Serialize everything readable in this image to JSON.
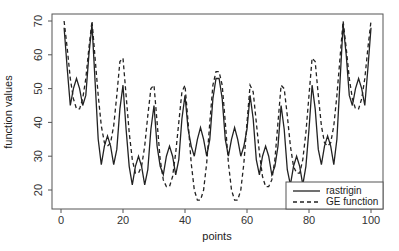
{
  "chart_data": {
    "type": "line",
    "title": "",
    "xlabel": "points",
    "ylabel": "function values",
    "xlim": [
      -2,
      103
    ],
    "ylim": [
      15,
      72
    ],
    "xticks": [
      0,
      20,
      40,
      60,
      80,
      100
    ],
    "yticks": [
      20,
      30,
      40,
      50,
      60,
      70
    ],
    "grid": false,
    "legend_position": "bottom-right",
    "x": [
      1,
      2,
      3,
      4,
      5,
      6,
      7,
      8,
      9,
      10,
      11,
      12,
      13,
      14,
      15,
      16,
      17,
      18,
      19,
      20,
      21,
      22,
      23,
      24,
      25,
      26,
      27,
      28,
      29,
      30,
      31,
      32,
      33,
      34,
      35,
      36,
      37,
      38,
      39,
      40,
      41,
      42,
      43,
      44,
      45,
      46,
      47,
      48,
      49,
      50,
      51,
      52,
      53,
      54,
      55,
      56,
      57,
      58,
      59,
      60,
      61,
      62,
      63,
      64,
      65,
      66,
      67,
      68,
      69,
      70,
      71,
      72,
      73,
      74,
      75,
      76,
      77,
      78,
      79,
      80,
      81,
      82,
      83,
      84,
      85,
      86,
      87,
      88,
      89,
      90,
      91,
      92,
      93,
      94,
      95,
      96,
      97,
      98,
      99,
      100
    ],
    "series": [
      {
        "name": "rastrigin",
        "style": "solid",
        "values": [
          68,
          56,
          45,
          50,
          53,
          50,
          45,
          48,
          60,
          69,
          52,
          35,
          27.5,
          33,
          36,
          33,
          27.5,
          32,
          44,
          51,
          38,
          27,
          21.5,
          27,
          30,
          27,
          21.5,
          26,
          38,
          45,
          33,
          27,
          24.5,
          30,
          33,
          30,
          24.5,
          29,
          41,
          48,
          38,
          33,
          30,
          35,
          38.5,
          35,
          30,
          35,
          47,
          53,
          53,
          47,
          35,
          30,
          35,
          38.5,
          35,
          30,
          33,
          38,
          48,
          41,
          29,
          24.5,
          30,
          33,
          30,
          24.5,
          27,
          33,
          45,
          38,
          26,
          21.5,
          27,
          30,
          27,
          21.5,
          27,
          38,
          51,
          44,
          32,
          27.5,
          33,
          36,
          33,
          27.5,
          35,
          52,
          69,
          60,
          48,
          45,
          50,
          53,
          50,
          45,
          56,
          68
        ]
      },
      {
        "name": "GE function",
        "style": "dashed",
        "values": [
          70,
          62,
          53,
          47,
          44,
          44,
          47,
          53,
          62,
          70,
          59,
          48,
          39,
          34,
          33,
          34,
          39,
          48,
          58,
          59,
          48,
          37,
          29,
          25,
          25,
          27,
          33,
          42,
          50,
          51,
          40,
          29,
          23,
          21,
          21,
          24,
          31,
          40,
          49,
          51,
          40,
          28,
          20,
          17,
          17,
          20,
          28,
          40,
          51,
          55,
          55,
          51,
          40,
          28,
          20,
          17,
          17,
          20,
          28,
          40,
          51,
          49,
          40,
          31,
          24,
          21,
          21,
          23,
          29,
          40,
          51,
          50,
          42,
          33,
          27,
          25,
          25,
          29,
          37,
          48,
          59,
          58,
          48,
          39,
          34,
          33,
          34,
          39,
          48,
          59,
          70,
          62,
          53,
          47,
          44,
          44,
          47,
          53,
          62,
          70
        ]
      }
    ]
  },
  "legend": {
    "items": [
      {
        "label": "rastrigin",
        "style": "solid"
      },
      {
        "label": "GE function",
        "style": "dashed"
      }
    ]
  },
  "axes": {
    "xlabel": "points",
    "ylabel": "function values",
    "xtick_labels": [
      "0",
      "20",
      "40",
      "60",
      "80",
      "100"
    ],
    "ytick_labels": [
      "20",
      "30",
      "40",
      "50",
      "60",
      "70"
    ]
  },
  "colors": {
    "line": "#222222",
    "axis": "#555555",
    "background": "#ffffff"
  }
}
